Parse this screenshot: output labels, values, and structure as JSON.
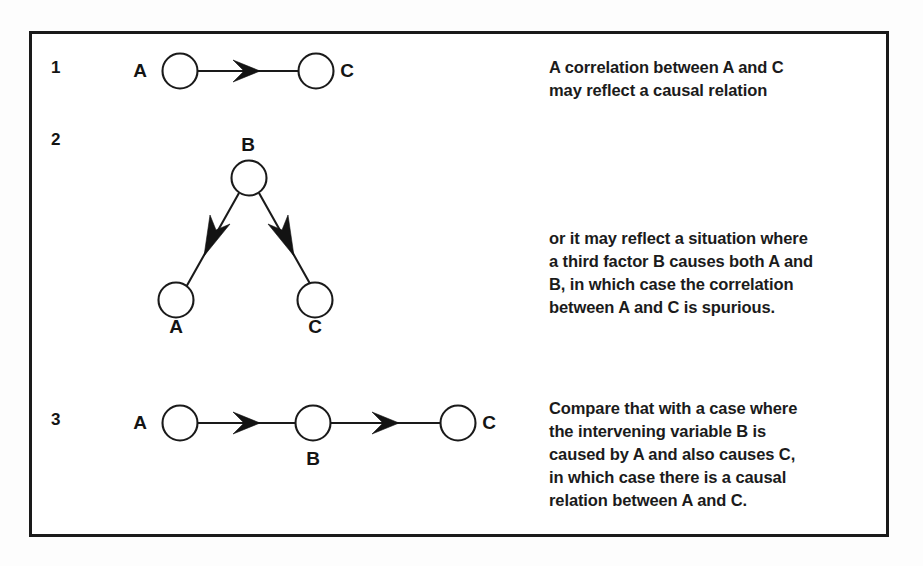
{
  "figure": {
    "background_color": "#fdfdfd",
    "panel_color": "#ffffff",
    "ink_color": "#1a1a1a",
    "rows": [
      {
        "number": "1",
        "diagram": {
          "type": "chain",
          "nodes": [
            "A",
            "C"
          ],
          "arrows": [
            {
              "from": "A",
              "to": "C"
            }
          ]
        },
        "caption_lines": [
          "A correlation between A and C",
          "may reflect a causal relation"
        ]
      },
      {
        "number": "2",
        "diagram": {
          "type": "common-cause",
          "nodes": [
            "B",
            "A",
            "C"
          ],
          "arrows": [
            {
              "from": "B",
              "to": "A"
            },
            {
              "from": "B",
              "to": "C"
            }
          ]
        },
        "caption_lines": [
          "or it may reflect a situation where",
          "a third factor B causes both A and",
          "B, in which case the correlation",
          "between A and C is spurious."
        ]
      },
      {
        "number": "3",
        "diagram": {
          "type": "chain",
          "nodes": [
            "A",
            "B",
            "C"
          ],
          "arrows": [
            {
              "from": "A",
              "to": "B"
            },
            {
              "from": "B",
              "to": "C"
            }
          ]
        },
        "caption_lines": [
          "Compare that with a case where",
          "the intervening variable B is",
          "caused by A and also causes C,",
          "in which case there is a causal",
          "relation between A and C."
        ]
      }
    ]
  }
}
